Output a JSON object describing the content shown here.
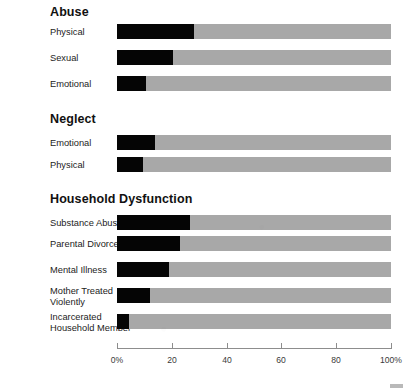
{
  "chart_data": {
    "type": "bar",
    "title": "",
    "xlabel": "",
    "ylabel": "",
    "orientation": "horizontal",
    "stacked": true,
    "xlim": [
      0,
      100
    ],
    "grid": false,
    "legend": "none",
    "tick_labels": [
      "0%",
      "20",
      "40",
      "60",
      "80",
      "100%"
    ],
    "tick_values": [
      0,
      20,
      40,
      60,
      80,
      100
    ],
    "series": [
      {
        "name": "Prevalence",
        "color": "#050505"
      },
      {
        "name": "Remainder",
        "color": "#a8a8a8"
      }
    ],
    "groups": [
      {
        "heading": "Abuse",
        "categories": [
          "Physical",
          "Sexual",
          "Emotional"
        ],
        "values": [
          28,
          20.5,
          10.5
        ]
      },
      {
        "heading": "Neglect",
        "categories": [
          "Emotional",
          "Physical"
        ],
        "values": [
          14,
          9.5
        ]
      },
      {
        "heading": "Household Dysfunction",
        "categories": [
          "Substance Abuse",
          "Parental Divorce",
          "Mental Illness",
          "Mother Treated\nViolently",
          "Incarcerated\nHousehold Member"
        ],
        "values": [
          26.5,
          23,
          19,
          12,
          4.5
        ]
      }
    ]
  },
  "colors": {
    "bar_fill": "#050505",
    "bar_track": "#a8a8a8",
    "axis": "#8d8d8d",
    "text": "#1c1c1c",
    "heading": "#111111",
    "background": "#ffffff"
  },
  "headings": {
    "abuse": "Abuse",
    "neglect": "Neglect",
    "household": "Household Dysfunction"
  },
  "labels": {
    "abuse_physical": "Physical",
    "abuse_sexual": "Sexual",
    "abuse_emotional": "Emotional",
    "neglect_emotional": "Emotional",
    "neglect_physical": "Physical",
    "hh_substance": "Substance Abuse",
    "hh_divorce": "Parental Divorce",
    "hh_mental": "Mental Illness",
    "hh_mother_l1": "Mother Treated",
    "hh_mother_l2": "Violently",
    "hh_incarc_l1": "Incarcerated",
    "hh_incarc_l2": "Household Member"
  },
  "axis": {
    "t0": "0%",
    "t20": "20",
    "t40": "40",
    "t60": "60",
    "t80": "80",
    "t100": "100%"
  }
}
